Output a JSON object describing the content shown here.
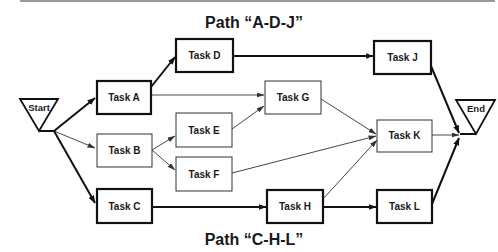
{
  "diagram": {
    "type": "network-diagram",
    "title_top": "Path “A-D-J”",
    "title_bottom": "Path “C-H-L”",
    "terminals": {
      "start": "Start",
      "end": "End"
    },
    "nodes": [
      {
        "id": "A",
        "label": "Task A",
        "critical": true
      },
      {
        "id": "B",
        "label": "Task B",
        "critical": false
      },
      {
        "id": "C",
        "label": "Task C",
        "critical": true
      },
      {
        "id": "D",
        "label": "Task D",
        "critical": true
      },
      {
        "id": "E",
        "label": "Task E",
        "critical": false
      },
      {
        "id": "F",
        "label": "Task F",
        "critical": false
      },
      {
        "id": "G",
        "label": "Task G",
        "critical": false
      },
      {
        "id": "H",
        "label": "Task H",
        "critical": true
      },
      {
        "id": "J",
        "label": "Task J",
        "critical": true
      },
      {
        "id": "K",
        "label": "Task K",
        "critical": false
      },
      {
        "id": "L",
        "label": "Task L",
        "critical": true
      }
    ],
    "edges": [
      {
        "from": "Start",
        "to": "A",
        "bold": true
      },
      {
        "from": "Start",
        "to": "B",
        "bold": false
      },
      {
        "from": "Start",
        "to": "C",
        "bold": true
      },
      {
        "from": "A",
        "to": "D",
        "bold": true
      },
      {
        "from": "A",
        "to": "G",
        "bold": false
      },
      {
        "from": "B",
        "to": "E",
        "bold": false
      },
      {
        "from": "B",
        "to": "F",
        "bold": false
      },
      {
        "from": "E",
        "to": "G",
        "bold": false
      },
      {
        "from": "F",
        "to": "K",
        "bold": false
      },
      {
        "from": "G",
        "to": "K",
        "bold": false
      },
      {
        "from": "C",
        "to": "H",
        "bold": true
      },
      {
        "from": "H",
        "to": "K",
        "bold": false
      },
      {
        "from": "H",
        "to": "L",
        "bold": true
      },
      {
        "from": "D",
        "to": "J",
        "bold": true
      },
      {
        "from": "J",
        "to": "End",
        "bold": true
      },
      {
        "from": "K",
        "to": "End",
        "bold": false
      },
      {
        "from": "L",
        "to": "End",
        "bold": true
      }
    ]
  }
}
